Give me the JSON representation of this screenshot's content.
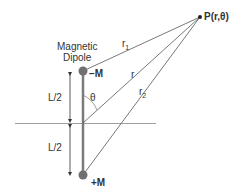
{
  "diagram": {
    "title_line1": "Magnetic",
    "title_line2": "Dipole",
    "point_label": "P(r,θ)",
    "neg_pole": "−M",
    "pos_pole": "+M",
    "r1": "r",
    "r1_sub": "1",
    "r": "r",
    "r2": "r",
    "r2_sub": "2",
    "theta": "θ",
    "half_length_top": "L/2",
    "half_length_bottom": "L/2",
    "colors": {
      "line": "#555555",
      "pole": "#707070",
      "rod": "#7a7a7a"
    }
  }
}
